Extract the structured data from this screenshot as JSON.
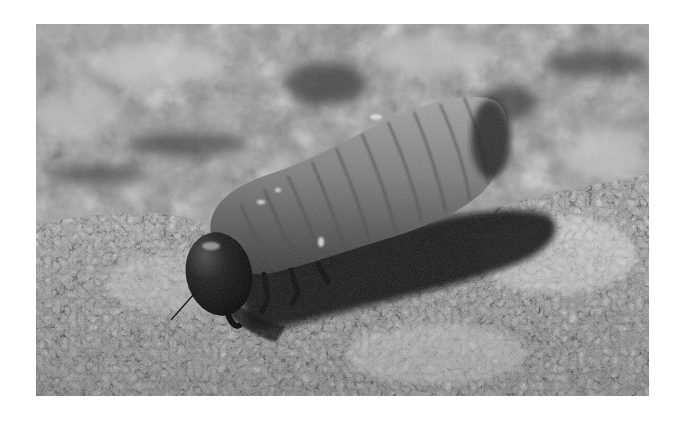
{
  "image": {
    "subject": "beetle larva (grub) crawling on rough bark/stone surface",
    "style": "grayscale photograph",
    "colors": {
      "background": "#ffffff",
      "surface_light": "#c8c8c8",
      "surface_mid": "#8c8c8c",
      "surface_dark": "#2a2a2a",
      "larva_body": "#7a7a7a",
      "larva_head": "#151515",
      "shadow": "#0e0e0e"
    }
  }
}
